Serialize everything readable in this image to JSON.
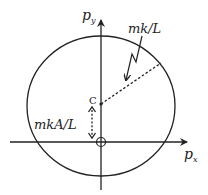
{
  "diagram": {
    "colors": {
      "stroke": "#222222",
      "background": "#ffffff"
    },
    "axes": {
      "x_label_main": "p",
      "x_label_sub": "x",
      "y_label_main": "p",
      "y_label_sub": "y"
    },
    "center_label": "C",
    "radius_label": "mk/L",
    "offset_label": "mkA/L",
    "origin_marker": "circle-cross"
  }
}
